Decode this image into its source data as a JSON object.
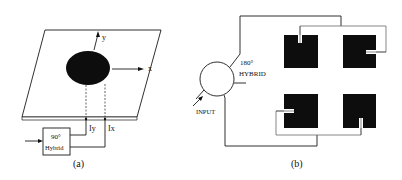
{
  "panel_a": {
    "caption": "(a)",
    "axis_x_label": "x",
    "axis_y_label": "y",
    "port_y_label": "Iy",
    "port_x_label": "Ix",
    "hybrid_label_line1": "90°",
    "hybrid_label_line2": "Hybrid"
  },
  "panel_b": {
    "caption": "(b)",
    "hybrid_label_line1": "180°",
    "hybrid_label_line2": "HYBRID",
    "input_label": "INPUT",
    "patch_count": 4
  },
  "colors": {
    "patch": "#0d0d0d",
    "line": "#1a1a1a",
    "background": "#ffffff"
  }
}
